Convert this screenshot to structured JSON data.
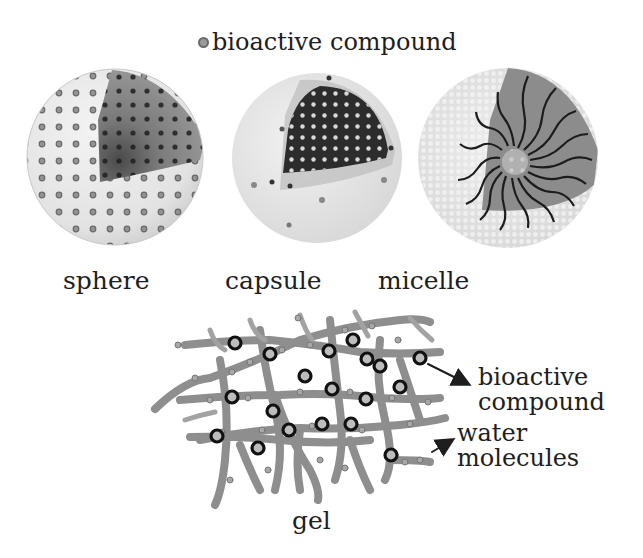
{
  "legend": {
    "icon": "bioactive-compound-dot-icon",
    "label": "bioactive compound"
  },
  "structures": [
    {
      "id": "sphere",
      "label": "sphere"
    },
    {
      "id": "capsule",
      "label": "capsule"
    },
    {
      "id": "micelle",
      "label": "micelle"
    },
    {
      "id": "gel",
      "label": "gel"
    }
  ],
  "gel_annotations": {
    "compound_line1": "bioactive",
    "compound_line2": "compound",
    "water_line1": "water",
    "water_line2": "molecules"
  },
  "colors": {
    "background": "#ffffff",
    "text": "#1e1e1e",
    "shell_light": "#e6e6e6",
    "sphere_core": "#8a8a8a",
    "capsule_core": "#2e2e2e",
    "micelle_core": "#6e6e6e",
    "gel_fiber": "#8c8c8c",
    "compound_ring": "#1a1a1a"
  }
}
